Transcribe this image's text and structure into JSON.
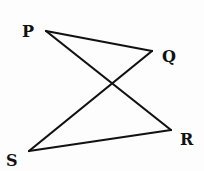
{
  "diagram": {
    "type": "geometry-figure",
    "stroke_color": "#111111",
    "background_color": "#fdfdfd",
    "points": {
      "P": {
        "label": "P",
        "x": 46,
        "y": 31,
        "label_x": 22,
        "label_y": 37
      },
      "Q": {
        "label": "Q",
        "x": 152,
        "y": 51,
        "label_x": 162,
        "label_y": 62
      },
      "R": {
        "label": "R",
        "x": 171,
        "y": 130,
        "label_x": 180,
        "label_y": 145
      },
      "S": {
        "label": "S",
        "x": 29,
        "y": 151,
        "label_x": 6,
        "label_y": 166
      }
    },
    "segments": [
      {
        "from": "P",
        "to": "Q"
      },
      {
        "from": "P",
        "to": "R"
      },
      {
        "from": "Q",
        "to": "S"
      },
      {
        "from": "S",
        "to": "R"
      }
    ]
  }
}
